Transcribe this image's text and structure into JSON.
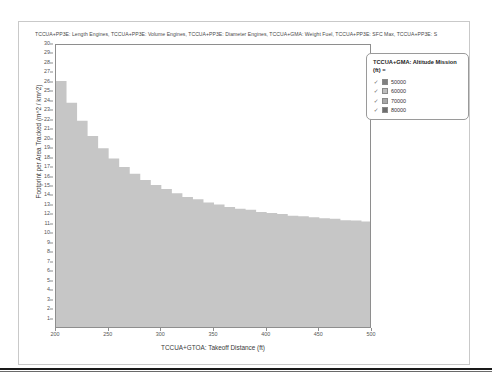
{
  "chart_title": "TCCUA+PP3E: Length Engines, TCCUA+PP3E: Volume Engines, TCCUA+PP3E: Diameter Engines, TCCUA+GMA: Weight Fuel, TCCUA+PP3E: SFC Max, TCCUA+PP3E: S",
  "legend": {
    "title": "TCCUA+GMA: Altitude Mission (ft) =",
    "items": [
      {
        "label": "50000",
        "color": "#808080",
        "checked": "✓"
      },
      {
        "label": "60000",
        "color": "#bdbdbd",
        "checked": "✓"
      },
      {
        "label": "70000",
        "color": "#a8a8a8",
        "checked": "✓"
      },
      {
        "label": "80000",
        "color": "#6e6e6e",
        "checked": "✓"
      }
    ]
  },
  "chart_data": {
    "type": "area",
    "title": "TCCUA+PP3E: Length Engines, TCCUA+PP3E: Volume Engines, TCCUA+PP3E: Diameter Engines, TCCUA+GMA: Weight Fuel, TCCUA+PP3E: SFC Max, TCCUA+PP3E: S",
    "xlabel": "TCCUA+GTOA: Takeoff Distance (ft)",
    "ylabel": "Footprint per Area Tracked (m^2 / km^2)",
    "xlim": [
      200,
      500
    ],
    "ylim": [
      0,
      30
    ],
    "xticks": [
      200,
      250,
      300,
      350,
      400,
      450,
      500
    ],
    "yticks": [
      1,
      2,
      3,
      4,
      5,
      6,
      7,
      8,
      9,
      10,
      11,
      12,
      13,
      14,
      15,
      16,
      17,
      18,
      19,
      20,
      21,
      22,
      23,
      24,
      25,
      26,
      27,
      28,
      29,
      30
    ],
    "grid": false,
    "legend_position": "top-right",
    "stacked": true,
    "x": [
      200,
      210,
      220,
      230,
      240,
      250,
      260,
      270,
      280,
      290,
      300,
      310,
      320,
      330,
      340,
      350,
      360,
      370,
      380,
      390,
      400,
      410,
      420,
      430,
      440,
      450,
      460,
      470,
      480,
      490,
      500
    ],
    "series": [
      {
        "name": "80000",
        "color": "#6e6e6e",
        "values": [
          4.6,
          4.55,
          4.5,
          4.45,
          4.4,
          4.35,
          4.3,
          4.3,
          4.25,
          4.2,
          4.2,
          4.15,
          4.1,
          4.1,
          4.05,
          4.05,
          4.0,
          4.0,
          4.0,
          3.95,
          3.95,
          3.95,
          3.9,
          3.9,
          3.9,
          3.9,
          3.9,
          3.85,
          3.85,
          3.85,
          3.85
        ]
      },
      {
        "name": "50000",
        "color": "#8a8a8a",
        "values": [
          3.0,
          2.95,
          2.9,
          2.85,
          2.8,
          2.75,
          2.7,
          2.65,
          2.6,
          2.55,
          2.5,
          2.45,
          2.4,
          2.4,
          2.35,
          2.3,
          2.3,
          2.25,
          2.25,
          2.2,
          2.2,
          2.2,
          2.15,
          2.15,
          2.15,
          2.1,
          2.1,
          2.1,
          2.1,
          2.05,
          2.05
        ]
      },
      {
        "name": "70000",
        "color": "#a8a8a8",
        "values": [
          3.6,
          3.5,
          3.4,
          3.3,
          3.2,
          3.1,
          3.0,
          2.95,
          2.9,
          2.85,
          2.8,
          2.75,
          2.7,
          2.65,
          2.6,
          2.6,
          2.55,
          2.5,
          2.5,
          2.45,
          2.45,
          2.4,
          2.4,
          2.4,
          2.35,
          2.35,
          2.35,
          2.3,
          2.3,
          2.3,
          2.3
        ]
      },
      {
        "name": "60000",
        "color": "#c6c6c6",
        "values": [
          15.0,
          12.9,
          11.2,
          9.8,
          8.7,
          7.8,
          7.1,
          6.5,
          6.0,
          5.6,
          5.3,
          5.0,
          4.75,
          4.55,
          4.35,
          4.2,
          4.05,
          3.95,
          3.85,
          3.75,
          3.65,
          3.6,
          3.5,
          3.45,
          3.4,
          3.35,
          3.3,
          3.25,
          3.2,
          3.15,
          3.1
        ]
      }
    ]
  }
}
